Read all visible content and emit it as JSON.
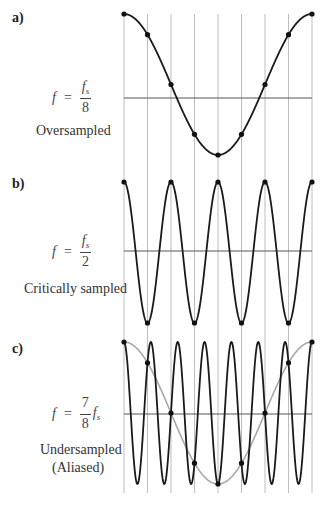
{
  "figure": {
    "sample_line_color": "#bdbdbd",
    "axis_color": "#555555",
    "signal_color": "#1a1a1a",
    "alias_color": "#a8a8a8",
    "sample_dot_color": "#111111",
    "num_samples": 9,
    "panels": [
      {
        "label": "a)",
        "formula": {
          "lhs": "f",
          "eq": "=",
          "num": "f",
          "num_sub": "s",
          "den": "8",
          "suffix": "",
          "suffix_sub": ""
        },
        "captions": [
          "Oversampled"
        ],
        "cycles_per_sample": 0.125
      },
      {
        "label": "b)",
        "formula": {
          "lhs": "f",
          "eq": "=",
          "num": "f",
          "num_sub": "s",
          "den": "2",
          "suffix": "",
          "suffix_sub": ""
        },
        "captions": [
          "Critically sampled"
        ],
        "cycles_per_sample": 0.5
      },
      {
        "label": "c)",
        "formula": {
          "lhs": "f",
          "eq": "=",
          "num": "7",
          "num_sub": "",
          "den": "8",
          "suffix": "f",
          "suffix_sub": "s"
        },
        "captions": [
          "Undersampled",
          "(Aliased)"
        ],
        "cycles_per_sample": 0.875,
        "alias_cycles_per_sample": 0.125
      }
    ]
  },
  "chart_data": {
    "type": "line",
    "x": [
      0,
      1,
      2,
      3,
      4,
      5,
      6,
      7,
      8
    ],
    "xlabel": "sample index n",
    "ylabel": "amplitude",
    "ylim": [
      -1,
      1
    ],
    "grid": "vertical lines at each sample",
    "series": [
      {
        "name": "a) f = fs/8 (Oversampled)",
        "function": "cos(2π·(1/8)·n)",
        "samples": [
          1,
          0.707,
          0,
          -0.707,
          -1,
          -0.707,
          0,
          0.707,
          1
        ]
      },
      {
        "name": "b) f = fs/2 (Critically sampled)",
        "function": "cos(2π·(1/2)·n)",
        "samples": [
          1,
          -1,
          1,
          -1,
          1,
          -1,
          1,
          -1,
          1
        ]
      },
      {
        "name": "c) f = 7/8 fs (Undersampled, Aliased)",
        "function": "cos(2π·(7/8)·n)",
        "samples": [
          1,
          0.707,
          0,
          -0.707,
          -1,
          -0.707,
          0,
          0.707,
          1
        ]
      },
      {
        "name": "c) alias f = fs/8 (gray)",
        "function": "cos(2π·(1/8)·n)",
        "samples": [
          1,
          0.707,
          0,
          -0.707,
          -1,
          -0.707,
          0,
          0.707,
          1
        ]
      }
    ]
  }
}
